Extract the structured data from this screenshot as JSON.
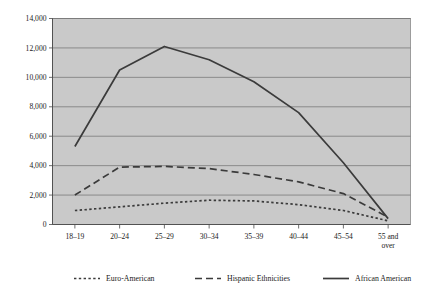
{
  "chart_data": {
    "type": "line",
    "title": "",
    "subtitle": "",
    "xlabel": "",
    "ylabel": "",
    "ylim": [
      0,
      14000
    ],
    "y_ticks": [
      0,
      2000,
      4000,
      6000,
      8000,
      10000,
      12000,
      14000
    ],
    "y_tick_labels": [
      "0",
      "2,000",
      "4,000",
      "6,000",
      "8,000",
      "10,000",
      "12,000",
      "14,000"
    ],
    "grid": true,
    "legend_position": "bottom",
    "categories": [
      "18–19",
      "20–24",
      "25–29",
      "30–34",
      "35–39",
      "40–44",
      "45–54",
      "55 and over"
    ],
    "category_lines": [
      [
        "18–19"
      ],
      [
        "20–24"
      ],
      [
        "25–29"
      ],
      [
        "30–34"
      ],
      [
        "35–39"
      ],
      [
        "40–44"
      ],
      [
        "45–54"
      ],
      [
        "55 and",
        "over"
      ]
    ],
    "series": [
      {
        "name": "Euro-American",
        "style": "dotted",
        "color": "#3b3b3b",
        "values": [
          950,
          1200,
          1450,
          1650,
          1600,
          1350,
          950,
          250
        ]
      },
      {
        "name": "Hispanic Ethnicities",
        "style": "dashed",
        "color": "#3b3b3b",
        "values": [
          2000,
          3900,
          3950,
          3800,
          3400,
          2900,
          2100,
          500
        ]
      },
      {
        "name": "African American",
        "style": "solid",
        "color": "#3b3b3b",
        "values": [
          5300,
          10500,
          12100,
          11200,
          9700,
          7600,
          4200,
          400
        ]
      }
    ]
  },
  "legend": {
    "items": [
      {
        "label": "Euro-American",
        "style": "dotted"
      },
      {
        "label": "Hispanic Ethnicities",
        "style": "dashed"
      },
      {
        "label": "African American",
        "style": "solid"
      }
    ]
  },
  "colors": {
    "plot_background": "#c9c9c9",
    "gridline": "#6e6e6e",
    "series_stroke": "#3b3b3b",
    "page_background": "#ffffff",
    "text": "#1a1a1a"
  }
}
